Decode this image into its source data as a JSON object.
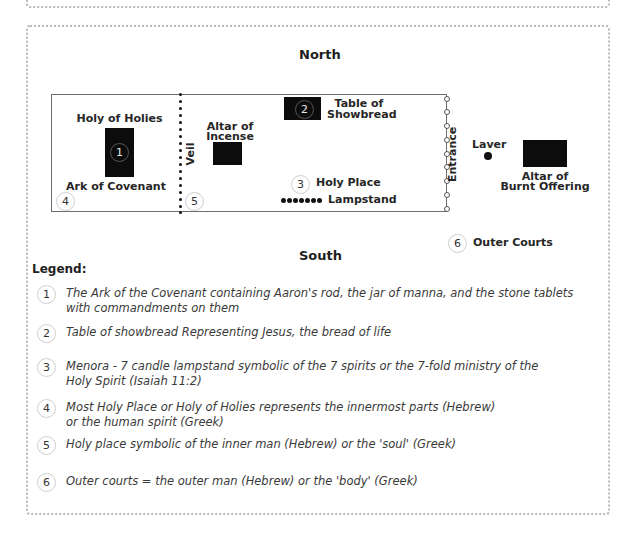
{
  "diagram": {
    "directions": {
      "north": "North",
      "south": "South"
    },
    "labels": {
      "holy_of_holies": "Holy of Holies",
      "ark_of_covenant": "Ark of Covenant",
      "veil": "Veil",
      "altar_of_incense_line1": "Altar of",
      "altar_of_incense_line2": "Incense",
      "table_of_showbread_line1": "Table of",
      "table_of_showbread_line2": "Showbread",
      "holy_place": "Holy Place",
      "lampstand": "Lampstand",
      "entrance": "Entrance",
      "laver": "Laver",
      "altar_burnt_line1": "Altar of",
      "altar_burnt_line2": "Burnt Offering",
      "outer_courts": "Outer Courts"
    },
    "markers": {
      "m1": "1",
      "m2": "2",
      "m3": "3",
      "m4": "4",
      "m5": "5",
      "m6": "6"
    }
  },
  "legend": {
    "title": "Legend:",
    "items": [
      {
        "num": "1",
        "text": "The Ark of the Covenant containing Aaron's rod, the jar of manna, and the stone tablets with commandments on them"
      },
      {
        "num": "2",
        "text": "Table of showbread Representing Jesus, the bread of life"
      },
      {
        "num": "3",
        "text": "Menora - 7 candle lampstand symbolic of the 7 spirits or the 7-fold ministry of the Holy Spirit (Isaiah 11:2)"
      },
      {
        "num": "4",
        "text": "Most Holy Place or Holy of Holies represents the innermost parts (Hebrew) or the human spirit (Greek)"
      },
      {
        "num": "5",
        "text": "Holy place symbolic of the inner man (Hebrew) or the 'soul' (Greek)"
      },
      {
        "num": "6",
        "text": "Outer courts = the outer man (Hebrew) or the 'body' (Greek)"
      }
    ]
  }
}
